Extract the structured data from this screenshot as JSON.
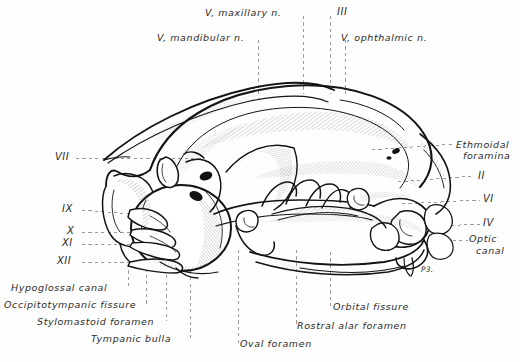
{
  "figure": {
    "background_color": "#fefefe",
    "ink_color": "#1a1a1a",
    "leader_color": "#8c8c8c"
  },
  "labels": {
    "top": [
      {
        "id": "v-maxillary",
        "text": "V, maxillary n.",
        "x": 205,
        "y": 8
      },
      {
        "id": "cn-iii",
        "text": "III",
        "x": 337,
        "y": 8
      },
      {
        "id": "v-mandibular",
        "text": "V, mandibular n.",
        "x": 158,
        "y": 33
      },
      {
        "id": "v-ophthalmic",
        "text": "V, ophthalmic n.",
        "x": 340,
        "y": 33
      }
    ],
    "left": [
      {
        "id": "cn-vii",
        "text": "VII",
        "x": 56,
        "y": 150
      },
      {
        "id": "cn-ix",
        "text": "IX",
        "x": 63,
        "y": 205
      },
      {
        "id": "cn-x",
        "text": "X",
        "x": 68,
        "y": 228
      },
      {
        "id": "cn-xi",
        "text": "XI",
        "x": 63,
        "y": 240
      },
      {
        "id": "cn-xii",
        "text": "XII",
        "x": 58,
        "y": 259
      }
    ],
    "right": [
      {
        "id": "ethmoidal-foramina-1",
        "text": "Ethmoidal",
        "x": 457,
        "y": 140
      },
      {
        "id": "ethmoidal-foramina-2",
        "text": "foramina",
        "x": 464,
        "y": 151
      },
      {
        "id": "cn-ii",
        "text": "II",
        "x": 478,
        "y": 176
      },
      {
        "id": "cn-vi",
        "text": "VI",
        "x": 483,
        "y": 199
      },
      {
        "id": "cn-iv",
        "text": "IV",
        "x": 483,
        "y": 222
      },
      {
        "id": "optic-canal-1",
        "text": "Optic",
        "x": 470,
        "y": 237
      },
      {
        "id": "optic-canal-2",
        "text": "canal",
        "x": 477,
        "y": 249
      }
    ],
    "bottom": [
      {
        "id": "hypoglossal-canal",
        "text": "Hypoglossal canal",
        "x": 12,
        "y": 283
      },
      {
        "id": "occipitotympanic-fissure",
        "text": "Occipitotympanic fissure",
        "x": 5,
        "y": 300
      },
      {
        "id": "stylomastoid-foramen",
        "text": "Stylomastoid foramen",
        "x": 38,
        "y": 317
      },
      {
        "id": "tympanic-bulla",
        "text": "Tympanic bulla",
        "x": 92,
        "y": 334
      },
      {
        "id": "oval-foramen",
        "text": "Oval foramen",
        "x": 240,
        "y": 340
      },
      {
        "id": "orbital-fissure",
        "text": "Orbital fissure",
        "x": 333,
        "y": 303
      },
      {
        "id": "rostral-alar-foramen",
        "text": "Rostral alar foramen",
        "x": 298,
        "y": 322
      }
    ],
    "inline": [
      {
        "id": "tooth-marker",
        "text": "P3.",
        "x": 420,
        "y": 266
      }
    ]
  },
  "leaders": {
    "vertical": [
      {
        "id": "leader-v-mandibular",
        "x": 258,
        "y1": 40,
        "y2": 98
      },
      {
        "id": "leader-v-maxillary",
        "x": 303,
        "y1": 16,
        "y2": 92
      },
      {
        "id": "leader-cn-iii",
        "x": 330,
        "y1": 16,
        "y2": 92
      },
      {
        "id": "leader-v-ophthalmic",
        "x": 345,
        "y1": 40,
        "y2": 92
      },
      {
        "id": "leader-hypoglossal",
        "x": 128,
        "y1": 262,
        "y2": 288
      },
      {
        "id": "leader-occipitotympanic",
        "x": 146,
        "y1": 262,
        "y2": 305
      },
      {
        "id": "leader-stylomastoid",
        "x": 166,
        "y1": 255,
        "y2": 322
      },
      {
        "id": "leader-tympanic",
        "x": 190,
        "y1": 255,
        "y2": 338
      },
      {
        "id": "leader-oval",
        "x": 238,
        "y1": 250,
        "y2": 344
      },
      {
        "id": "leader-rostral-alar",
        "x": 296,
        "y1": 248,
        "y2": 326
      },
      {
        "id": "leader-orbital",
        "x": 330,
        "y1": 248,
        "y2": 308
      }
    ],
    "horizontal": [
      {
        "id": "leader-cn-vii",
        "y": 158,
        "x1": 76,
        "x2": 200
      },
      {
        "id": "leader-cn-ix",
        "y": 210,
        "x1": 80,
        "x2": 128
      },
      {
        "id": "leader-cn-x",
        "y": 232,
        "x1": 80,
        "x2": 130
      },
      {
        "id": "leader-cn-xi",
        "y": 244,
        "x1": 80,
        "x2": 130
      },
      {
        "id": "leader-cn-xii",
        "y": 262,
        "x1": 80,
        "x2": 128
      },
      {
        "id": "leader-ethmoidal",
        "y": 148,
        "x1": 372,
        "x2": 452
      },
      {
        "id": "leader-cn-ii",
        "y": 180,
        "x1": 400,
        "x2": 474
      },
      {
        "id": "leader-cn-vi",
        "y": 203,
        "x1": 404,
        "x2": 480
      },
      {
        "id": "leader-cn-iv",
        "y": 226,
        "x1": 404,
        "x2": 480
      },
      {
        "id": "leader-optic",
        "y": 240,
        "x1": 410,
        "x2": 468
      }
    ]
  }
}
